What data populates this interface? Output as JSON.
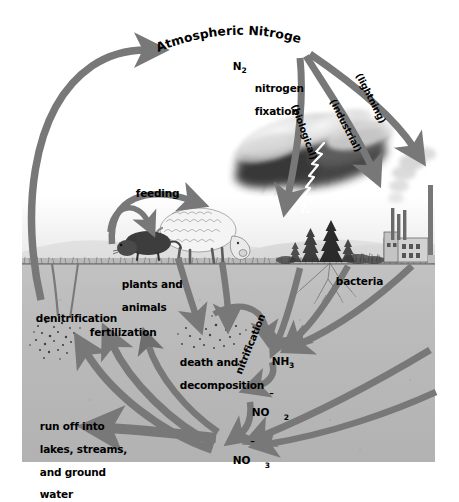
{
  "diagram": {
    "type": "biogeochemical-cycle-illustration",
    "background_color": "#ffffff",
    "arrow_color": "#787878",
    "soil_color": "#b9b9b9",
    "sky_color": "#ffffff"
  },
  "labels": {
    "atmospheric_nitrogen": "Atmospheric Nitrogen",
    "n2_formula": "N",
    "n2_sub": "2",
    "nitrogen_fixation_l1": "nitrogen",
    "nitrogen_fixation_l2": "fixation",
    "lightning": "(lightning)",
    "industrial": "(industrial)",
    "biological": "(biological)",
    "feeding": "feeding",
    "plants_and_animals_l1": "plants and",
    "plants_and_animals_l2": "animals",
    "bacteria": "bacteria",
    "denitrification": "denitrification",
    "fertilization": "fertilization",
    "death_and_decomposition_l1": "death and",
    "death_and_decomposition_l2": "decomposition",
    "ammonia": "NH",
    "ammonia_sub": "3",
    "nitrification": "nitrification",
    "nitrite": "NO",
    "nitrite_sub": "2",
    "nitrite_charge": "–",
    "nitrate": "NO",
    "nitrate_sub": "3",
    "nitrate_charge": "–",
    "runoff_l1": "run off into",
    "runoff_l2": "lakes, streams,",
    "runoff_l3": "and ground",
    "runoff_l4": "water"
  },
  "scene": {
    "storm_cloud": "storm-cloud-with-lightning",
    "factory": "factory-with-smokestacks",
    "sheep": "grazing-sheep",
    "rodent": "rodent",
    "trees": "conifer-trees",
    "roots": "plant-root-system",
    "detritus": "decomposing-matter-speckles"
  },
  "curved_title": {
    "chars": [
      "A",
      "t",
      "m",
      "o",
      "s",
      "p",
      "h",
      "e",
      "r",
      "i",
      "c",
      " ",
      "N",
      "i",
      "t",
      "r",
      "o",
      "g",
      "e",
      "n"
    ]
  }
}
